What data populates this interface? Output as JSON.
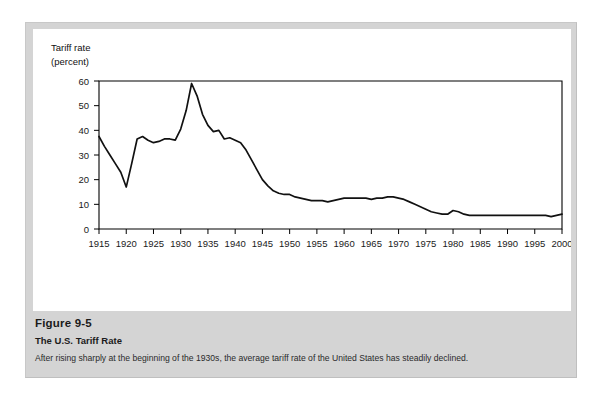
{
  "figure": {
    "number": "Figure 9-5",
    "subtitle": "The U.S. Tariff Rate",
    "description": "After rising sharply at the beginning of the 1930s, the average tariff rate of the United States has steadily declined."
  },
  "chart_data": {
    "type": "line",
    "title": "",
    "xlabel": "",
    "ylabel": "Tariff rate (percent)",
    "ylabel_line1": "Tariff rate",
    "ylabel_line2": "(percent)",
    "xlim": [
      1915,
      2000
    ],
    "ylim": [
      0,
      60
    ],
    "grid": false,
    "legend": "none",
    "yticks": [
      0,
      10,
      20,
      30,
      40,
      50,
      60
    ],
    "xticks": [
      1915,
      1920,
      1925,
      1930,
      1935,
      1940,
      1945,
      1950,
      1955,
      1960,
      1965,
      1970,
      1975,
      1980,
      1985,
      1990,
      1995,
      2000
    ],
    "series": [
      {
        "name": "U.S. average tariff rate",
        "color": "#111111",
        "x": [
          1915,
          1916,
          1917,
          1918,
          1919,
          1920,
          1921,
          1922,
          1923,
          1924,
          1925,
          1926,
          1927,
          1928,
          1929,
          1930,
          1931,
          1932,
          1933,
          1934,
          1935,
          1936,
          1937,
          1938,
          1939,
          1940,
          1941,
          1942,
          1943,
          1944,
          1945,
          1946,
          1947,
          1948,
          1949,
          1950,
          1951,
          1952,
          1953,
          1954,
          1955,
          1956,
          1957,
          1958,
          1959,
          1960,
          1961,
          1962,
          1963,
          1964,
          1965,
          1966,
          1967,
          1968,
          1969,
          1970,
          1971,
          1972,
          1973,
          1974,
          1975,
          1976,
          1977,
          1978,
          1979,
          1980,
          1981,
          1982,
          1983,
          1984,
          1985,
          1986,
          1987,
          1988,
          1989,
          1990,
          1991,
          1992,
          1993,
          1994,
          1995,
          1996,
          1997,
          1998,
          1999,
          2000
        ],
        "y": [
          37.5,
          33.5,
          30.0,
          26.5,
          23.0,
          17.0,
          26.5,
          36.5,
          37.5,
          36.0,
          35.0,
          35.5,
          36.5,
          36.5,
          36.0,
          40.5,
          48.0,
          59.0,
          54.0,
          46.5,
          42.0,
          39.5,
          40.0,
          36.5,
          37.0,
          36.0,
          35.0,
          32.0,
          28.0,
          24.0,
          20.0,
          17.5,
          15.5,
          14.5,
          14.0,
          14.0,
          13.0,
          12.5,
          12.0,
          11.5,
          11.5,
          11.5,
          11.0,
          11.5,
          12.0,
          12.5,
          12.5,
          12.5,
          12.5,
          12.5,
          12.0,
          12.5,
          12.5,
          13.0,
          13.0,
          12.5,
          12.0,
          11.0,
          10.0,
          9.0,
          8.0,
          7.0,
          6.5,
          6.0,
          6.0,
          7.5,
          7.0,
          6.0,
          5.5,
          5.5,
          5.5,
          5.5,
          5.5,
          5.5,
          5.5,
          5.5,
          5.5,
          5.5,
          5.5,
          5.5,
          5.5,
          5.5,
          5.5,
          5.0,
          5.5,
          6.0
        ]
      }
    ]
  }
}
